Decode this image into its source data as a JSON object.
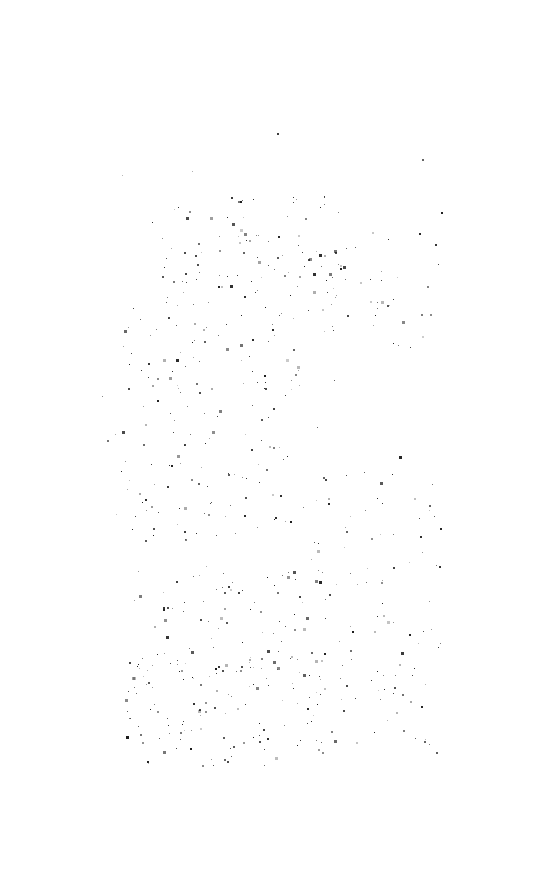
{
  "document": {
    "kind": "scanned-page",
    "condition": "fully-degraded",
    "legible_text": "",
    "page_background": "#ffffff",
    "speck_color": "#1a1a1a",
    "width": 544,
    "height": 885
  },
  "content": {
    "heading": "",
    "body_text": "",
    "caption": "",
    "page_number": ""
  },
  "speckle_field": {
    "bounds": {
      "x": 100,
      "y": 128,
      "width": 342,
      "height": 642
    },
    "approx_count": 620,
    "seed": 20250514,
    "density_zones": [
      {
        "x": 150,
        "y": 195,
        "width": 190,
        "height": 110,
        "weight": 2.6
      },
      {
        "x": 120,
        "y": 300,
        "width": 180,
        "height": 120,
        "weight": 1.9
      },
      {
        "x": 115,
        "y": 430,
        "width": 175,
        "height": 110,
        "weight": 2.1
      },
      {
        "x": 125,
        "y": 560,
        "width": 200,
        "height": 120,
        "weight": 2.4
      },
      {
        "x": 125,
        "y": 660,
        "width": 200,
        "height": 110,
        "weight": 3.0
      },
      {
        "x": 300,
        "y": 230,
        "width": 140,
        "height": 120,
        "weight": 1.2
      },
      {
        "x": 310,
        "y": 470,
        "width": 130,
        "height": 150,
        "weight": 1.0
      },
      {
        "x": 330,
        "y": 620,
        "width": 110,
        "height": 130,
        "weight": 1.1
      },
      {
        "x": 100,
        "y": 128,
        "width": 342,
        "height": 642,
        "weight": 0.55
      }
    ],
    "isolated_specks": [
      {
        "x": 277,
        "y": 133,
        "size": 2,
        "opacity": 0.85
      },
      {
        "x": 436,
        "y": 752,
        "size": 2,
        "opacity": 0.7
      },
      {
        "x": 107,
        "y": 440,
        "size": 2,
        "opacity": 0.6
      },
      {
        "x": 430,
        "y": 314,
        "size": 2,
        "opacity": 0.5
      }
    ]
  }
}
